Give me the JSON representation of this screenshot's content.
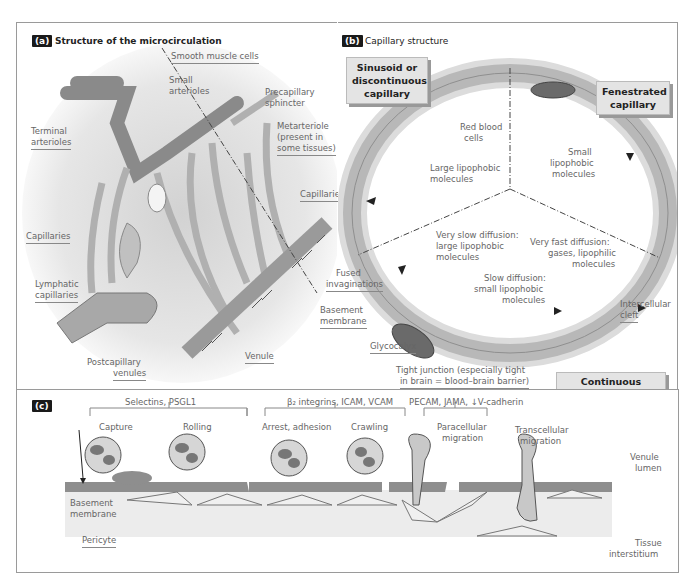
{
  "panel_a": {
    "tag": "(a)",
    "title": "Structure of the microcirculation",
    "labels": {
      "smooth_muscle": "Smooth muscle cells",
      "small_arterioles_1": "Small",
      "small_arterioles_2": "arterioles",
      "precap_1": "Precapillary",
      "precap_2": "sphincter",
      "terminal_1": "Terminal",
      "terminal_2": "arterioles",
      "metarteriole_1": "Metarteriole",
      "metarteriole_2": "(present in",
      "metarteriole_3": "some tissues)",
      "capillaries_right": "Capillaries",
      "capillaries_left": "Capillaries",
      "lymphatic_1": "Lymphatic",
      "lymphatic_2": "capillaries",
      "venule": "Venule",
      "postcap_1": "Postcapillary",
      "postcap_2": "venules"
    }
  },
  "panel_b": {
    "tag": "(b)",
    "title": "Capillary structure",
    "boxes": {
      "sinusoid": [
        "Sinusoid or",
        "discontinuous",
        "capillary"
      ],
      "fenestrated": [
        "Fenestrated",
        "capillary"
      ],
      "continuous": [
        "Continuous capillary"
      ]
    },
    "labels": {
      "rbc_1": "Red blood",
      "rbc_2": "cells",
      "small_lipo_1": "Small",
      "small_lipo_2": "lipophobic",
      "small_lipo_3": "molecules",
      "large_lipo_1": "Large lipophobic",
      "large_lipo_2": "molecules",
      "very_slow_1": "Very slow diffusion:",
      "very_slow_2": "large lipophobic",
      "very_slow_3": "molecules",
      "very_fast_1": "Very fast diffusion:",
      "very_fast_2": "gases, lipophilic",
      "very_fast_3": "molecules",
      "fused_1": "Fused",
      "fused_2": "invaginations",
      "slow_1": "Slow diffusion:",
      "slow_2": "small lipophobic",
      "slow_3": "molecules",
      "intercellular_1": "Intercellular",
      "intercellular_2": "cleft",
      "basement_1": "Basement",
      "basement_2": "membrane",
      "glycocalyx": "Glycocalyx",
      "tight_1": "Tight junction (especially tight",
      "tight_2": "in brain = blood–brain barrier)"
    }
  },
  "panel_c": {
    "tag": "(c)",
    "groups": [
      {
        "label": "Selectins, PSGL1",
        "steps": [
          "Capture",
          "Rolling"
        ]
      },
      {
        "label": "β₂ integrins, ICAM, VCAM",
        "steps": [
          "Arrest, adhesion",
          "Crawling"
        ]
      },
      {
        "label": "PECAM, JAMA, ↓V-cadherin",
        "steps": [
          "Paracellular migration"
        ]
      }
    ],
    "extra_step": [
      "Transcellular",
      "migration"
    ],
    "para_1": "Paracellular",
    "para_2": "migration",
    "labels": {
      "venule_1": "Venule",
      "venule_2": "lumen",
      "tissue_1": "Tissue",
      "tissue_2": "interstitium",
      "basement_1": "Basement",
      "basement_2": "membrane",
      "pericyte": "Pericyte"
    }
  },
  "colors": {
    "vessel": "#a8a8a8",
    "vessel_dark": "#6e6e6e",
    "nucleus": "#5a5a5a",
    "box_bg": "#e4e4e4",
    "tag_bg": "#1a1a1a"
  }
}
